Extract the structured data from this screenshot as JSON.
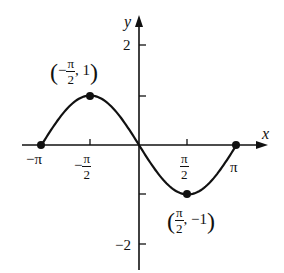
{
  "chart_data": {
    "type": "line",
    "title": "",
    "function": "y = -sin(x)",
    "xlabel": "x",
    "ylabel": "y",
    "xlim": [
      -3.14159,
      3.14159
    ],
    "ylim": [
      -2,
      2
    ],
    "grid": false,
    "x_ticks": [
      {
        "value": -3.14159,
        "label": "-π"
      },
      {
        "value": -1.5708,
        "label": "-π/2"
      },
      {
        "value": 1.5708,
        "label": "π/2"
      },
      {
        "value": 3.14159,
        "label": "π"
      }
    ],
    "y_ticks": [
      {
        "value": 2,
        "label": "2"
      },
      {
        "value": 1,
        "label": ""
      },
      {
        "value": -1,
        "label": ""
      },
      {
        "value": -2,
        "label": "-2"
      }
    ],
    "series": [
      {
        "name": "y = -sin x",
        "x": [
          -3.14159,
          -2.35619,
          -1.5708,
          -0.7854,
          0,
          0.7854,
          1.5708,
          2.35619,
          3.14159
        ],
        "y": [
          0,
          0.7071,
          1,
          0.7071,
          0,
          -0.7071,
          -1,
          -0.7071,
          0
        ]
      }
    ],
    "highlighted_points": [
      {
        "x": -3.14159,
        "y": 0,
        "label": ""
      },
      {
        "x": -1.5708,
        "y": 1,
        "label": "(-π/2, 1)"
      },
      {
        "x": 1.5708,
        "y": -1,
        "label": "(π/2, -1)"
      },
      {
        "x": 3.14159,
        "y": 0,
        "label": ""
      }
    ],
    "annotations": [
      "(-π/2, 1)",
      "(π/2, -1)"
    ]
  },
  "labels": {
    "axis_x": "x",
    "axis_y": "y",
    "tick_neg_pi": "−π",
    "tick_pi": "π",
    "tick_y_2": "2",
    "tick_y_neg2": "−2",
    "pi": "π",
    "two": "2",
    "minus": "−",
    "max_point_y": "1",
    "min_point_y": "−1",
    "open_paren": "(",
    "close_paren": ")",
    "comma": ","
  },
  "colors": {
    "ink": "#111111",
    "background": "#ffffff"
  }
}
